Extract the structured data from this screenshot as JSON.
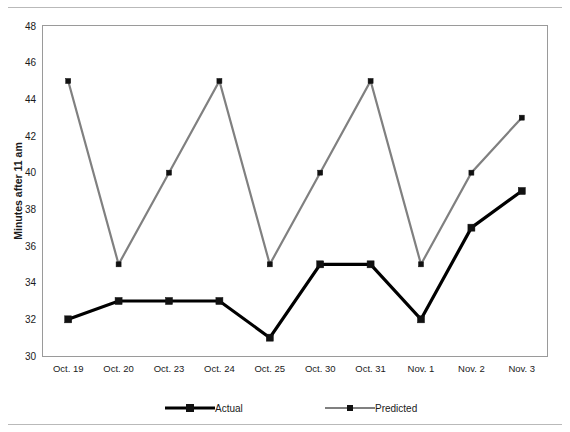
{
  "chart_data": {
    "type": "line",
    "title": "",
    "xlabel": "",
    "ylabel": "Minutes after 11 am",
    "categories": [
      "Oct. 19",
      "Oct. 20",
      "Oct. 23",
      "Oct. 24",
      "Oct. 25",
      "Oct. 30",
      "Oct. 31",
      "Nov. 1",
      "Nov. 2",
      "Nov. 3"
    ],
    "series": [
      {
        "name": "Actual",
        "color": "#000000",
        "marker": "square",
        "values": [
          32,
          33,
          33,
          33,
          31,
          35,
          35,
          32,
          37,
          39
        ]
      },
      {
        "name": "Predicted",
        "color": "#808080",
        "marker": "square",
        "values": [
          45,
          35,
          40,
          45,
          35,
          40,
          45,
          35,
          40,
          43
        ]
      }
    ],
    "ylim": [
      30,
      48
    ],
    "yticks": [
      30,
      32,
      34,
      36,
      38,
      40,
      42,
      44,
      46,
      48
    ],
    "ytick_labels": [
      "30",
      "32",
      "34",
      "36",
      "38",
      "40",
      "42",
      "44",
      "46",
      "48"
    ],
    "grid": false,
    "legend_position": "bottom"
  },
  "legend": {
    "entries": [
      {
        "label": "Actual"
      },
      {
        "label": "Predicted"
      }
    ]
  }
}
